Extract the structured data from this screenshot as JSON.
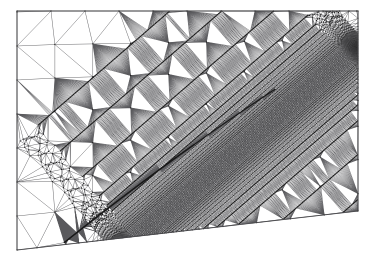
{
  "figure": {
    "title": "Adaptive triangular finite element mesh",
    "type": "mesh-plot",
    "caption": "",
    "background_color": "#ffffff",
    "edge_color": "#59595c",
    "boundary_color": "#4a4a4d",
    "node_color": "#1a1a1a",
    "canvas": {
      "width": 373,
      "height": 265
    }
  },
  "chart_data": {
    "type": "mesh",
    "title": "Adaptive triangular finite element mesh",
    "xlabel": "",
    "ylabel": "",
    "grid": false,
    "legend": null,
    "domain": {
      "shape": "quadrilateral",
      "corners": [
        {
          "name": "top-left",
          "x": 17,
          "y": 11
        },
        {
          "name": "top-right",
          "x": 358,
          "y": 11
        },
        {
          "name": "bottom-right",
          "x": 358,
          "y": 211
        },
        {
          "name": "bottom-left",
          "x": 17,
          "y": 250
        }
      ]
    },
    "refinement": {
      "feature": "diagonal-line-singularity",
      "start": {
        "x": 124,
        "y": 249
      },
      "end": {
        "x": 357,
        "y": 47
      },
      "min_element_size": 1.2,
      "max_element_size": 34.0,
      "grading_falloff": 0.062,
      "band_half_width": 7.0,
      "endpoint_cluster_radius": 16.0,
      "endpoint_min_size": 0.45
    },
    "coarse_region": {
      "nominal_size": 34.0,
      "structured": true,
      "columns": 9,
      "rows": 7
    },
    "counts": {
      "approx_nodes": 4200,
      "approx_elements": 8200
    }
  }
}
